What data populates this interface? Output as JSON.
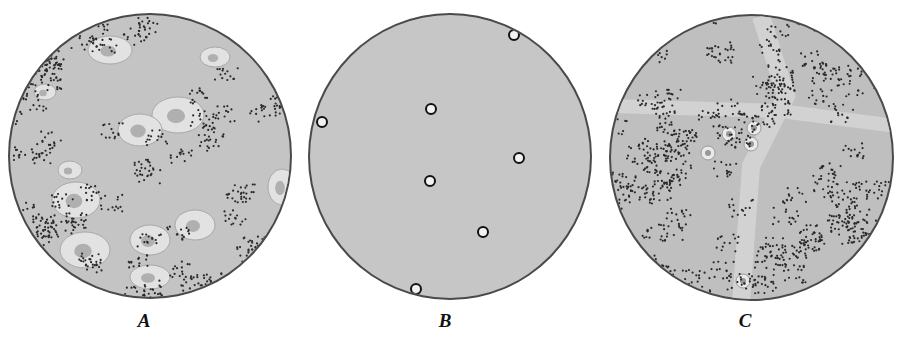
{
  "figure": {
    "panels": [
      {
        "id": "A",
        "label": "A",
        "description": "field with scattered bacteria clusters and large epithelial cells",
        "fill": "#c4c4c4"
      },
      {
        "id": "B",
        "label": "B",
        "description": "nearly empty field with seven small ring-shaped cells",
        "fill": "#c6c6c6"
      },
      {
        "id": "C",
        "label": "C",
        "description": "field densely packed with bacteria clusters and few cells",
        "fill": "#bfbfbf"
      }
    ],
    "colors": {
      "background": "#ffffff",
      "border": "#4a4a4a",
      "dots": "#2a2a2a",
      "cells": "#e2e2e2"
    }
  }
}
